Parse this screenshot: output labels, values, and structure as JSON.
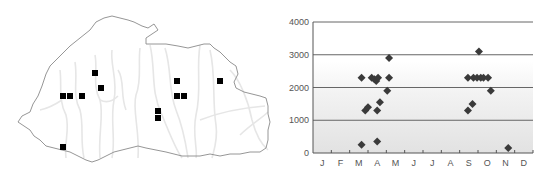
{
  "map": {
    "title": "",
    "marker_color": "#000000",
    "outline_color": "#8a8a8a",
    "river_color": "#e4e4e4",
    "markers": [
      {
        "x": 63,
        "y": 96
      },
      {
        "x": 70,
        "y": 96
      },
      {
        "x": 82,
        "y": 96
      },
      {
        "x": 95,
        "y": 73
      },
      {
        "x": 101,
        "y": 88
      },
      {
        "x": 177,
        "y": 81
      },
      {
        "x": 177,
        "y": 96
      },
      {
        "x": 184,
        "y": 96
      },
      {
        "x": 220,
        "y": 81
      },
      {
        "x": 158,
        "y": 111
      },
      {
        "x": 158,
        "y": 118
      },
      {
        "x": 63,
        "y": 147
      }
    ]
  },
  "chart_data": {
    "type": "scatter",
    "title": "",
    "xlabel": "",
    "ylabel": "",
    "categories": [
      "J",
      "F",
      "M",
      "A",
      "M",
      "J",
      "J",
      "A",
      "S",
      "O",
      "N",
      "D"
    ],
    "ylim": [
      0,
      4000
    ],
    "yticks": [
      0,
      1000,
      2000,
      3000,
      4000
    ],
    "ytick_labels": [
      "0",
      "1000",
      "2000",
      "3000",
      "4000"
    ],
    "grid": true,
    "legend": null,
    "marker": "diamond",
    "marker_color": "#3a3a3a",
    "points": [
      {
        "month": 2.65,
        "value": 250
      },
      {
        "month": 2.65,
        "value": 2300
      },
      {
        "month": 2.85,
        "value": 1300
      },
      {
        "month": 3.0,
        "value": 1400
      },
      {
        "month": 3.2,
        "value": 2300
      },
      {
        "month": 3.35,
        "value": 2250
      },
      {
        "month": 3.45,
        "value": 2200
      },
      {
        "month": 3.55,
        "value": 2300
      },
      {
        "month": 3.5,
        "value": 1300
      },
      {
        "month": 3.5,
        "value": 350
      },
      {
        "month": 3.65,
        "value": 1550
      },
      {
        "month": 4.05,
        "value": 1900
      },
      {
        "month": 4.15,
        "value": 2300
      },
      {
        "month": 4.15,
        "value": 2900
      },
      {
        "month": 8.45,
        "value": 1300
      },
      {
        "month": 8.45,
        "value": 2300
      },
      {
        "month": 8.7,
        "value": 1500
      },
      {
        "month": 8.75,
        "value": 2300
      },
      {
        "month": 8.95,
        "value": 2300
      },
      {
        "month": 9.05,
        "value": 3100
      },
      {
        "month": 9.15,
        "value": 2300
      },
      {
        "month": 9.3,
        "value": 2300
      },
      {
        "month": 9.55,
        "value": 2300
      },
      {
        "month": 9.7,
        "value": 1900
      },
      {
        "month": 10.65,
        "value": 150
      }
    ]
  }
}
